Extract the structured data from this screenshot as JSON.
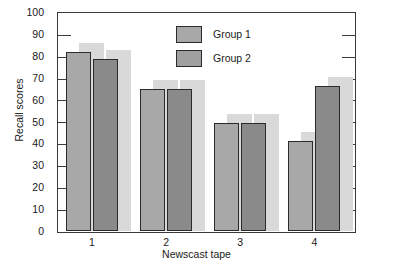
{
  "chart_data": {
    "type": "bar",
    "title": "",
    "subtitle": "",
    "xlabel": "Newscast tape",
    "ylabel": "Recall scores",
    "categories": [
      "1",
      "2",
      "3",
      "4"
    ],
    "series": [
      {
        "name": "Group 1",
        "values": [
          82,
          65,
          49.5,
          41.5
        ],
        "color": "#a8a8a8"
      },
      {
        "name": "Group 2",
        "values": [
          79,
          65,
          49.5,
          66.5
        ],
        "color": "#8a8a8a"
      }
    ],
    "ylim": [
      0,
      100
    ],
    "ytick_labels": [
      "0",
      "10",
      "20",
      "30",
      "40",
      "50",
      "60",
      "70",
      "80",
      "90",
      "100"
    ],
    "ytick_values": [
      0,
      10,
      20,
      30,
      40,
      50,
      60,
      70,
      80,
      90,
      100
    ],
    "xtick_labels": [
      "1",
      "2",
      "3",
      "4"
    ],
    "grid": false,
    "ticks_inward": true,
    "legend": {
      "position": "top-center-inside",
      "entries": [
        "Group 1",
        "Group 2"
      ]
    }
  },
  "figure": {
    "frame_color": "#3a3a3a",
    "bar_outline_color": "#2b2b2b",
    "shadow_color": "#d9d9d9",
    "background": "#ffffff"
  }
}
